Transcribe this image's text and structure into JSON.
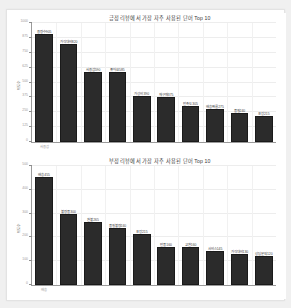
{
  "page": {
    "background_color": "#f0f0f0",
    "card_background_color": "#ffffff",
    "top_clipped_text": "",
    "bottom_clipped_text": ""
  },
  "style": {
    "bar_color": "#2b2b2b",
    "bar_edge_color": "#1a1a1a",
    "axis_color": "#9a9a9a",
    "grid_color": "#ededed",
    "title_color": "#3a3a3a",
    "tick_label_color": "#9b9b9b"
  },
  "chart_data": [
    {
      "type": "bar",
      "id": "positive-reviews-top10",
      "title": "긍정 리뷰에서 가장 자주 사용된 단어 Top 10",
      "xlabel": "",
      "ylabel": "빈도수",
      "grid": true,
      "legend": null,
      "ylim": [
        0,
        1000
      ],
      "yticks": [
        0,
        125,
        250,
        375,
        500,
        625,
        750,
        875,
        1000
      ],
      "ytick_labels": [
        "0",
        "125",
        "250",
        "375",
        "500",
        "625",
        "750",
        "875",
        "1000"
      ],
      "categories": [
        "사용감",
        "가성비",
        "배송",
        "만족",
        "품질",
        "재구매",
        "디자인",
        "추천",
        "가격",
        "포장"
      ],
      "values": [
        905,
        820,
        590,
        585,
        390,
        375,
        305,
        275,
        240,
        215
      ],
      "bar_labels": [
        "용량수905",
        "가격대비820",
        "사용감590",
        "좋아요585",
        "가성비390",
        "재구매375",
        "만족도305",
        "배송빠름275",
        "품질240",
        "포장215"
      ]
    },
    {
      "type": "bar",
      "id": "negative-reviews-top10",
      "title": "부정 리뷰에서 가장 자주 사용된 단어 Top 10",
      "xlabel": "",
      "ylabel": "빈도수",
      "grid": true,
      "legend": null,
      "ylim": [
        0,
        500
      ],
      "yticks": [
        0,
        100,
        200,
        300,
        400,
        500
      ],
      "ytick_labels": [
        "0",
        "100",
        "200",
        "300",
        "400",
        "500"
      ],
      "categories": [
        "배송",
        "불량",
        "환불",
        "품질",
        "포장",
        "반품",
        "교환",
        "서비스",
        "가격",
        "문의"
      ],
      "values": [
        455,
        300,
        265,
        240,
        215,
        160,
        160,
        145,
        130,
        120
      ],
      "bar_labels": [
        "배송455",
        "불량품300",
        "환불265",
        "품질불량240",
        "포장215",
        "반품160",
        "교환160",
        "서비스145",
        "가격대비130",
        "상담문의120"
      ]
    }
  ]
}
